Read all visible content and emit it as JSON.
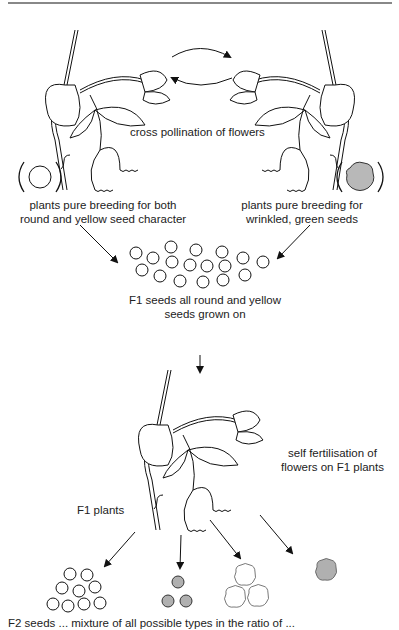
{
  "diagram": {
    "labels": {
      "cross_pollination": "cross pollination of flowers",
      "parent_left_line1": "plants pure breeding for both",
      "parent_left_line2": "round and yellow seed character",
      "parent_right_line1": "plants pure breeding for",
      "parent_right_line2": "wrinkled, green seeds",
      "f1_seeds_line1": "F1 seeds all round and yellow",
      "f1_seeds_line2": "seeds grown on",
      "self_fert_line1": "self fertilisation of",
      "self_fert_line2": "flowers  on F1 plants",
      "f1_plants": "F1 plants",
      "bottom_caption_cutoff": "F2 seeds ... mixture of all possible types in the ratio of ..."
    },
    "parents": [
      {
        "seed": "round-yellow",
        "fill": "#ffffff"
      },
      {
        "seed": "wrinkled-green",
        "fill": "#b8b8b8"
      }
    ],
    "f1_seed_count": 19,
    "f2_groups": [
      {
        "phenotype": "round yellow",
        "count": 9,
        "fill": "#ffffff"
      },
      {
        "phenotype": "round green",
        "count": 3,
        "fill": "#b0b0b0"
      },
      {
        "phenotype": "wrinkled yellow",
        "count": 3,
        "fill": "#ffffff"
      },
      {
        "phenotype": "wrinkled green",
        "count": 1,
        "fill": "#b0b0b0"
      }
    ]
  }
}
